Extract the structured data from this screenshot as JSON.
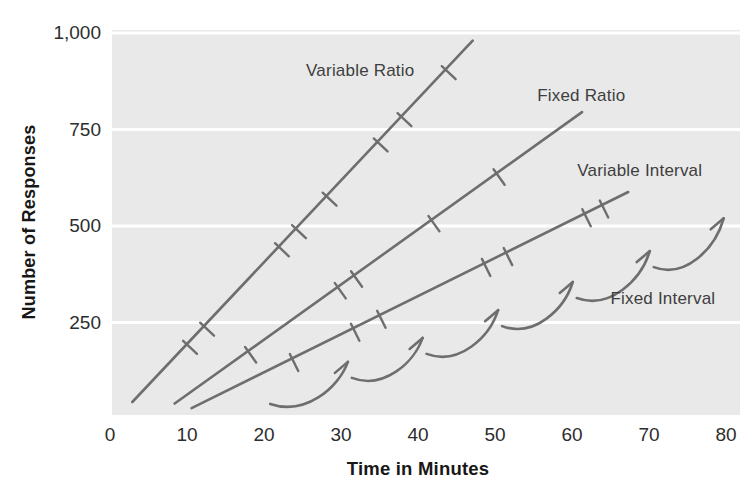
{
  "colors": {
    "plot_bg": "#e9e9e9",
    "gridline": "#ffffff",
    "line": "#6e6e6e",
    "series_label_text": "#3e3e3e",
    "axis_tick_text": "#2d2d2d",
    "axis_title_text": "#171717"
  },
  "chart_data": {
    "type": "line",
    "title": "",
    "xlabel": "Time in Minutes",
    "ylabel": "Number of Responses",
    "xlim": [
      0,
      80
    ],
    "ylim": [
      0,
      1000
    ],
    "x_ticks": [
      0,
      10,
      20,
      30,
      40,
      50,
      60,
      70,
      80
    ],
    "y_ticks": [
      250,
      500,
      750,
      1000
    ],
    "y_tick_labels": [
      "250",
      "500",
      "750",
      "1,000"
    ],
    "grid": "horizontal white gridlines on light gray panel, no axis lines",
    "legend": "inline labels next to each curve",
    "series": [
      {
        "name": "Variable Ratio",
        "style": "straight",
        "points": [
          [
            2.9,
            44
          ],
          [
            47.1,
            980
          ]
        ],
        "hatch_fractions": [
          0.16,
          0.21,
          0.43,
          0.48,
          0.57,
          0.72,
          0.79,
          0.92
        ],
        "label_pos": [
          32.5,
          901
        ]
      },
      {
        "name": "Fixed Ratio",
        "style": "straight",
        "points": [
          [
            8.4,
            40
          ],
          [
            61.3,
            795
          ]
        ],
        "hatch_fractions": [
          0.18,
          0.4,
          0.44,
          0.63,
          0.79
        ],
        "label_pos": [
          61.2,
          837
        ]
      },
      {
        "name": "Variable Interval",
        "style": "straight",
        "points": [
          [
            10.6,
            28
          ],
          [
            67.3,
            588
          ]
        ],
        "hatch_fractions": [
          0.23,
          0.37,
          0.43,
          0.67,
          0.72,
          0.9,
          0.94
        ],
        "label_pos": [
          68.8,
          642
        ]
      },
      {
        "name": "Fixed Interval",
        "style": "scalloped",
        "start": [
          20.8,
          39
        ],
        "cusps": [
          [
            30.9,
            148
          ],
          [
            40.6,
            210
          ],
          [
            50.4,
            282
          ],
          [
            60.1,
            355
          ],
          [
            70.1,
            435
          ],
          [
            79.7,
            520
          ]
        ],
        "label_pos": [
          71.8,
          311
        ]
      }
    ]
  }
}
